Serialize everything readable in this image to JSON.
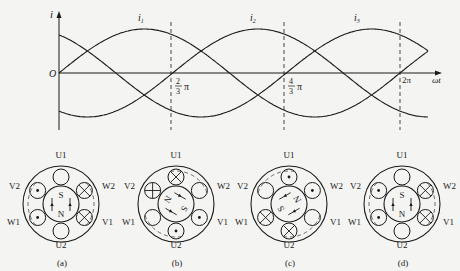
{
  "waveform": {
    "y_axis_label": "i",
    "x_axis_label": "ωt",
    "origin_label": "O",
    "curves": [
      {
        "name": "i1",
        "label": "i",
        "sub": "1",
        "phase_deg": 0
      },
      {
        "name": "i2",
        "label": "i",
        "sub": "2",
        "phase_deg": -120
      },
      {
        "name": "i3",
        "label": "i",
        "sub": "3",
        "phase_deg": -240
      }
    ],
    "markers": [
      {
        "num": "2",
        "den": "3",
        "sym": "π",
        "text": "2/3 π"
      },
      {
        "num": "4",
        "den": "3",
        "sym": "π",
        "text": "4/3 π"
      },
      {
        "num": "",
        "den": "",
        "sym": "2π",
        "text": "2π"
      }
    ]
  },
  "chart_data": {
    "type": "line",
    "title": "",
    "xlabel": "ωt",
    "ylabel": "i",
    "x_ticks": [
      "O",
      "2/3π",
      "4/3π",
      "2π"
    ],
    "series": [
      {
        "name": "i1",
        "values": "Im·sin(ωt)"
      },
      {
        "name": "i2",
        "values": "Im·sin(ωt − 2π/3)"
      },
      {
        "name": "i3",
        "values": "Im·sin(ωt − 4π/3)"
      }
    ],
    "x_range": [
      0,
      2.15
    ],
    "x_unit": "π"
  },
  "stators": [
    {
      "caption": "(a)",
      "rotor_angle_deg": 0,
      "top_pole": "S",
      "bottom_pole": "N",
      "slots": {
        "U1": "empty",
        "W2": "cross",
        "V1": "cross",
        "U2": "empty",
        "W1": "dot",
        "V2": "dot"
      }
    },
    {
      "caption": "(b)",
      "rotor_angle_deg": 120,
      "top_pole": "S",
      "bottom_pole": "N",
      "slots": {
        "U1": "cross",
        "W2": "empty",
        "V1": "dot",
        "U2": "dot",
        "W1": "empty",
        "V2": "plus"
      }
    },
    {
      "caption": "(c)",
      "rotor_angle_deg": 240,
      "top_pole": "S",
      "bottom_pole": "N",
      "slots": {
        "U1": "dot",
        "W2": "dot",
        "V1": "empty",
        "U2": "cross",
        "W1": "cross",
        "V2": "empty"
      }
    },
    {
      "caption": "(d)",
      "rotor_angle_deg": 360,
      "top_pole": "S",
      "bottom_pole": "N",
      "slots": {
        "U1": "empty",
        "W2": "cross",
        "V1": "cross",
        "U2": "empty",
        "W1": "dot",
        "V2": "dot"
      }
    }
  ],
  "slot_labels": {
    "U1": "U1",
    "W2": "W2",
    "V1": "V1",
    "U2": "U2",
    "W1": "W1",
    "V2": "V2"
  }
}
